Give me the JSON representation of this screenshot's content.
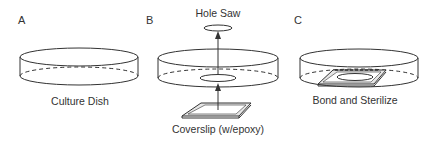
{
  "figure": {
    "panels": [
      {
        "id": "A",
        "letter": "A",
        "caption": "Culture Dish"
      },
      {
        "id": "B",
        "letter": "B",
        "caption": "Coverslip (w/epoxy)",
        "tool_label": "Hole Saw"
      },
      {
        "id": "C",
        "letter": "C",
        "caption": "Bond and Sterilize"
      }
    ],
    "colors": {
      "line": "#333333",
      "background": "#ffffff",
      "coverslip_fill": "#e6e6e6"
    }
  }
}
